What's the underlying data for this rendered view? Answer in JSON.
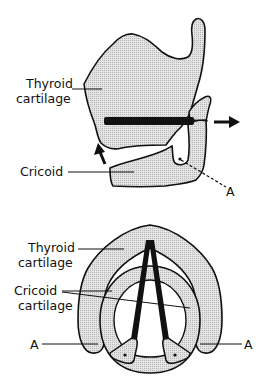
{
  "figure": {
    "background": "#ffffff",
    "fill_color": "#d9d9d9",
    "stroke_color": "#111111",
    "lateral_view": {
      "labels": {
        "thyroid_line1": "Thyroid",
        "thyroid_line2": "cartilage",
        "cricoid": "Cricoid",
        "point_a": "A"
      },
      "arrows": [
        "rotation-up-arrow",
        "pull-right-arrow"
      ]
    },
    "superior_view": {
      "labels": {
        "thyroid_line1": "Thyroid",
        "thyroid_line2": "cartilage",
        "cricoid_line1": "Cricoid",
        "cricoid_line2": "cartilage",
        "point_a_left": "A",
        "point_a_right": "A"
      }
    }
  }
}
